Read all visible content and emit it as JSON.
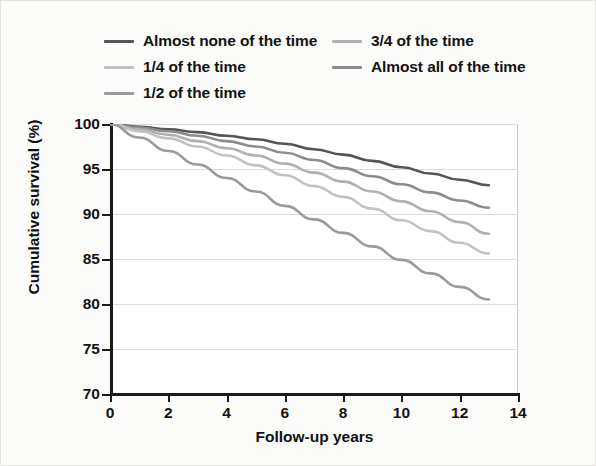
{
  "chart_data": {
    "type": "line",
    "title": "",
    "xlabel": "Follow-up years",
    "ylabel": "Cumulative survival (%)",
    "xlim": [
      0,
      14
    ],
    "ylim": [
      70,
      100
    ],
    "xticks": [
      0,
      2,
      4,
      6,
      8,
      10,
      12,
      14
    ],
    "yticks": [
      70,
      75,
      80,
      85,
      90,
      95,
      100
    ],
    "grid": true,
    "legend_position": "top",
    "x": [
      0,
      1,
      2,
      3,
      4,
      5,
      6,
      7,
      8,
      9,
      10,
      11,
      12,
      13
    ],
    "series": [
      {
        "name": "Almost none of the time",
        "color": "#555555",
        "values": [
          100.0,
          99.7,
          99.4,
          99.1,
          98.7,
          98.3,
          97.8,
          97.2,
          96.6,
          95.9,
          95.2,
          94.5,
          93.8,
          93.2
        ]
      },
      {
        "name": "Almost all of the time",
        "color": "#8c8c8c",
        "values": [
          100.0,
          99.6,
          99.2,
          98.7,
          98.1,
          97.5,
          96.8,
          96.0,
          95.1,
          94.2,
          93.3,
          92.4,
          91.5,
          90.7
        ]
      },
      {
        "name": "3/4 of the time",
        "color": "#b0b0b0",
        "values": [
          100.0,
          99.4,
          98.8,
          98.1,
          97.3,
          96.5,
          95.6,
          94.6,
          93.6,
          92.5,
          91.4,
          90.3,
          89.1,
          87.8
        ]
      },
      {
        "name": "1/4 of the time",
        "color": "#c2c2c2",
        "values": [
          100.0,
          99.2,
          98.4,
          97.5,
          96.5,
          95.4,
          94.3,
          93.1,
          91.9,
          90.6,
          89.3,
          88.1,
          86.8,
          85.6
        ]
      },
      {
        "name": "1/2 of the time",
        "color": "#9a9a9a",
        "values": [
          100.0,
          98.5,
          97.0,
          95.5,
          94.0,
          92.5,
          90.9,
          89.4,
          87.9,
          86.4,
          84.9,
          83.4,
          81.9,
          80.5
        ]
      }
    ]
  },
  "legend": {
    "items": [
      {
        "label": "Almost none of the time",
        "color": "#555555"
      },
      {
        "label": "1/4 of the time",
        "color": "#c2c2c2"
      },
      {
        "label": "1/2 of the time",
        "color": "#9a9a9a"
      },
      {
        "label": "3/4 of the time",
        "color": "#b0b0b0"
      },
      {
        "label": "Almost all of the time",
        "color": "#8c8c8c"
      }
    ]
  },
  "axes": {
    "x_label": "Follow-up years",
    "y_label": "Cumulative survival (%)",
    "x_tick_labels": [
      "0",
      "2",
      "4",
      "6",
      "8",
      "10",
      "12",
      "14"
    ],
    "y_tick_labels": [
      "100",
      "95",
      "90",
      "85",
      "80",
      "75",
      "70"
    ]
  }
}
